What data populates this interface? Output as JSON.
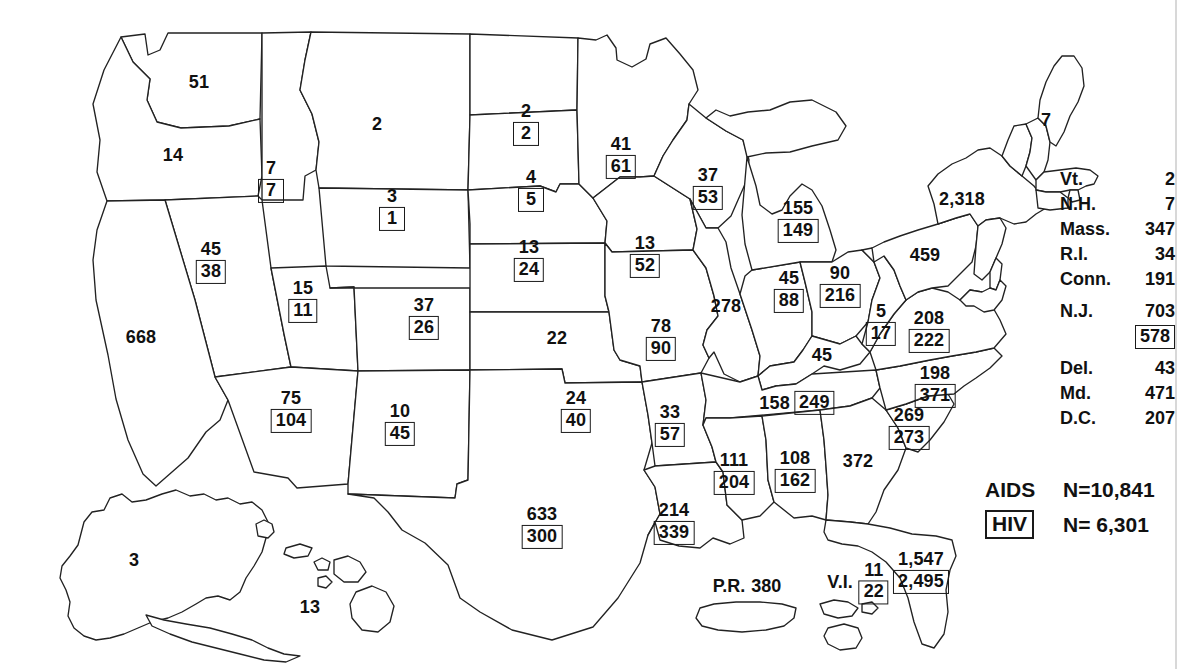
{
  "figure": {
    "type": "choropleth-style annotated US map"
  },
  "legend": {
    "aids_key": "AIDS",
    "aids_count": "N=10,841",
    "hiv_key": "HIV",
    "hiv_count": "N= 6,301"
  },
  "side_table": {
    "rows": [
      {
        "name": "Vt.",
        "aids": "2",
        "hiv": null,
        "spacer_after": false
      },
      {
        "name": "N.H.",
        "aids": "7",
        "hiv": null,
        "spacer_after": false
      },
      {
        "name": "Mass.",
        "aids": "347",
        "hiv": null,
        "spacer_after": false
      },
      {
        "name": "R.I.",
        "aids": "34",
        "hiv": null,
        "spacer_after": false
      },
      {
        "name": "Conn.",
        "aids": "191",
        "hiv": null,
        "spacer_after": true
      },
      {
        "name": "N.J.",
        "aids": "703",
        "hiv": "578",
        "spacer_after": true
      },
      {
        "name": "Del.",
        "aids": "43",
        "hiv": null,
        "spacer_after": false
      },
      {
        "name": "Md.",
        "aids": "471",
        "hiv": null,
        "spacer_after": false
      },
      {
        "name": "D.C.",
        "aids": "207",
        "hiv": null,
        "spacer_after": false
      }
    ]
  },
  "chart_data": {
    "type": "map",
    "aids_total": "10,841",
    "hiv_total": "6,301",
    "value_encoding": {
      "aids": "plain number (upper)",
      "hiv": "boxed number (lower)"
    },
    "states": [
      {
        "id": "WA",
        "name": "Washington",
        "aids": "51",
        "hiv": null,
        "x": 199,
        "y": 82,
        "layout": "stack"
      },
      {
        "id": "OR",
        "name": "Oregon",
        "aids": "14",
        "hiv": null,
        "x": 173,
        "y": 155,
        "layout": "stack"
      },
      {
        "id": "ID",
        "name": "Idaho",
        "aids": "7",
        "hiv": "7",
        "x": 271,
        "y": 181,
        "layout": "stack"
      },
      {
        "id": "MT",
        "name": "Montana",
        "aids": "2",
        "hiv": null,
        "x": 377,
        "y": 124,
        "layout": "stack"
      },
      {
        "id": "WY",
        "name": "Wyoming",
        "aids": "3",
        "hiv": "1",
        "x": 392,
        "y": 209,
        "layout": "stack"
      },
      {
        "id": "CA",
        "name": "California",
        "aids": "668",
        "hiv": null,
        "x": 141,
        "y": 337,
        "layout": "stack"
      },
      {
        "id": "NV",
        "name": "Nevada",
        "aids": "45",
        "hiv": "38",
        "x": 211,
        "y": 262,
        "layout": "stack"
      },
      {
        "id": "UT",
        "name": "Utah",
        "aids": "15",
        "hiv": "11",
        "x": 303,
        "y": 301,
        "layout": "stack"
      },
      {
        "id": "AZ",
        "name": "Arizona",
        "aids": "75",
        "hiv": "104",
        "x": 291,
        "y": 411,
        "layout": "stack"
      },
      {
        "id": "NM",
        "name": "New Mexico",
        "aids": "10",
        "hiv": "45",
        "x": 400,
        "y": 424,
        "layout": "stack"
      },
      {
        "id": "CO",
        "name": "Colorado",
        "aids": "37",
        "hiv": "26",
        "x": 424,
        "y": 318,
        "layout": "stack"
      },
      {
        "id": "ND",
        "name": "North Dakota",
        "aids": "2",
        "hiv": "2",
        "x": 526,
        "y": 124,
        "layout": "stack"
      },
      {
        "id": "SD",
        "name": "South Dakota",
        "aids": "4",
        "hiv": "5",
        "x": 531,
        "y": 190,
        "layout": "stack"
      },
      {
        "id": "NE",
        "name": "Nebraska",
        "aids": "13",
        "hiv": "24",
        "x": 529,
        "y": 260,
        "layout": "stack"
      },
      {
        "id": "KS",
        "name": "Kansas",
        "aids": "22",
        "hiv": null,
        "x": 557,
        "y": 338,
        "layout": "stack"
      },
      {
        "id": "OK",
        "name": "Oklahoma",
        "aids": "24",
        "hiv": "40",
        "x": 576,
        "y": 411,
        "layout": "stack"
      },
      {
        "id": "TX",
        "name": "Texas",
        "aids": "633",
        "hiv": "300",
        "x": 542,
        "y": 527,
        "layout": "stack"
      },
      {
        "id": "MN",
        "name": "Minnesota",
        "aids": "41",
        "hiv": "61",
        "x": 621,
        "y": 157,
        "layout": "stack"
      },
      {
        "id": "IA",
        "name": "Iowa",
        "aids": "13",
        "hiv": "52",
        "x": 645,
        "y": 256,
        "layout": "stack"
      },
      {
        "id": "MO",
        "name": "Missouri",
        "aids": "78",
        "hiv": "90",
        "x": 661,
        "y": 339,
        "layout": "stack"
      },
      {
        "id": "AR",
        "name": "Arkansas",
        "aids": "33",
        "hiv": "57",
        "x": 670,
        "y": 425,
        "layout": "stack"
      },
      {
        "id": "LA",
        "name": "Louisiana",
        "aids": "214",
        "hiv": "339",
        "x": 674,
        "y": 523,
        "layout": "stack"
      },
      {
        "id": "WI",
        "name": "Wisconsin",
        "aids": "37",
        "hiv": "53",
        "x": 708,
        "y": 188,
        "layout": "stack"
      },
      {
        "id": "IL",
        "name": "Illinois",
        "aids": "278",
        "hiv": null,
        "x": 726,
        "y": 306,
        "layout": "stack"
      },
      {
        "id": "MI",
        "name": "Michigan",
        "aids": "155",
        "hiv": "149",
        "x": 798,
        "y": 221,
        "layout": "stack"
      },
      {
        "id": "IN",
        "name": "Indiana",
        "aids": "45",
        "hiv": "88",
        "x": 789,
        "y": 291,
        "layout": "stack"
      },
      {
        "id": "OH",
        "name": "Ohio",
        "aids": "90",
        "hiv": "216",
        "x": 840,
        "y": 286,
        "layout": "stack"
      },
      {
        "id": "KY",
        "name": "Kentucky",
        "aids": "45",
        "hiv": null,
        "x": 822,
        "y": 355,
        "layout": "stack"
      },
      {
        "id": "TN",
        "name": "Tennessee",
        "aids": "158",
        "hiv": "249",
        "x": 797,
        "y": 403,
        "layout": "inline"
      },
      {
        "id": "MS",
        "name": "Mississippi",
        "aids": "111",
        "hiv": "204",
        "x": 734,
        "y": 473,
        "layout": "stack"
      },
      {
        "id": "AL",
        "name": "Alabama",
        "aids": "108",
        "hiv": "162",
        "x": 795,
        "y": 471,
        "layout": "stack"
      },
      {
        "id": "GA",
        "name": "Georgia",
        "aids": "372",
        "hiv": null,
        "x": 858,
        "y": 461,
        "layout": "stack"
      },
      {
        "id": "FL",
        "name": "Florida",
        "aids": "1,547",
        "hiv": "2,495",
        "x": 921,
        "y": 572,
        "layout": "stack"
      },
      {
        "id": "SC",
        "name": "South Carolina",
        "aids": "269",
        "hiv": "273",
        "x": 909,
        "y": 428,
        "layout": "stack"
      },
      {
        "id": "NC",
        "name": "North Carolina",
        "aids": "198",
        "hiv": "371",
        "x": 935,
        "y": 386,
        "layout": "stack"
      },
      {
        "id": "VA",
        "name": "Virginia",
        "aids": "208",
        "hiv": "222",
        "x": 929,
        "y": 331,
        "layout": "stack"
      },
      {
        "id": "WV",
        "name": "West Virginia",
        "aids": "5",
        "hiv": "17",
        "x": 881,
        "y": 324,
        "layout": "stack"
      },
      {
        "id": "PA",
        "name": "Pennsylvania",
        "aids": "459",
        "hiv": null,
        "x": 925,
        "y": 255,
        "layout": "stack"
      },
      {
        "id": "NY",
        "name": "New York",
        "aids": "2,318",
        "hiv": null,
        "x": 962,
        "y": 199,
        "layout": "stack"
      },
      {
        "id": "ME",
        "name": "Maine",
        "aids": "7",
        "hiv": null,
        "x": 1046,
        "y": 120,
        "layout": "stack"
      },
      {
        "id": "AK",
        "name": "Alaska",
        "aids": "3",
        "hiv": null,
        "x": 134,
        "y": 560,
        "layout": "stack"
      },
      {
        "id": "HI",
        "name": "Hawaii",
        "aids": "13",
        "hiv": null,
        "x": 310,
        "y": 607,
        "layout": "stack"
      }
    ],
    "territories": [
      {
        "id": "PR",
        "name": "P.R.",
        "label": "P.R.",
        "aids": "380",
        "hiv": null,
        "x": 747,
        "y": 586,
        "layout": "inline"
      },
      {
        "id": "VI",
        "name": "V.I.",
        "label": "V.I.",
        "aids": "11",
        "hiv": "22",
        "x": 858,
        "y": 583,
        "layout": "stack-right"
      }
    ]
  }
}
